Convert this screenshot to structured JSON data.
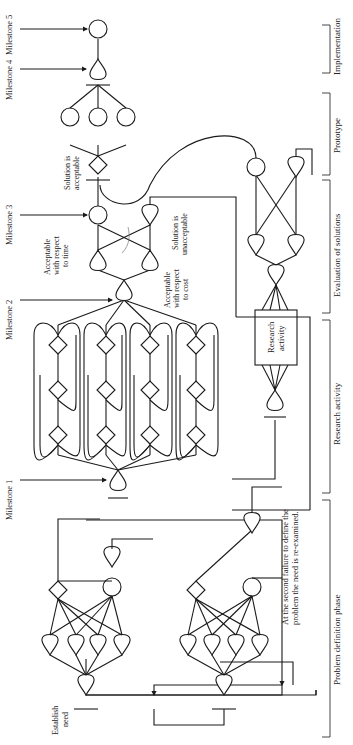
{
  "diagram": {
    "milestones": [
      "Milestone 1",
      "Milestone 2",
      "Milestone 3",
      "Milestone 4",
      "Milestone 5"
    ],
    "phases": [
      "Problem definition phase",
      "Research activity",
      "Evaluation of solutions",
      "Prototype",
      "Implementation"
    ],
    "labels": {
      "establish_need_1": "Establish",
      "establish_need_2": "need",
      "second_failure_1": "At the second failure to define the",
      "second_failure_2": "problem the need is re-examined.",
      "research_box_1": "Research",
      "research_box_2": "activity",
      "acceptable_time_1": "Acceptable",
      "acceptable_time_2": "with respect",
      "acceptable_time_3": "to time",
      "acceptable_cost_1": "Acceptable",
      "acceptable_cost_2": "with respect",
      "acceptable_cost_3": "to cost",
      "unacceptable_1": "Solution is",
      "unacceptable_2": "unacceptable",
      "acceptable_1": "Solution is",
      "acceptable_2": "acceptable"
    },
    "colors": {
      "ink": "#1a1a1a",
      "background": "#ffffff",
      "guide": "#777777"
    }
  }
}
